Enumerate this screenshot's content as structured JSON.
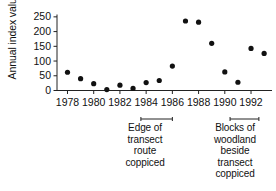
{
  "chart_data": {
    "type": "scatter",
    "title": "",
    "xlabel": "",
    "ylabel": "Annual index value",
    "x": [
      1978,
      1979,
      1980,
      1981,
      1982,
      1983,
      1984,
      1985,
      1986,
      1987,
      1988,
      1989,
      1990,
      1991,
      1992,
      1993
    ],
    "values": [
      62,
      40,
      23,
      3,
      18,
      7,
      27,
      34,
      83,
      236,
      232,
      160,
      63,
      28,
      143,
      126
    ],
    "series": [
      {
        "name": "Annual index value",
        "values": [
          62,
          40,
          23,
          3,
          18,
          7,
          27,
          34,
          83,
          236,
          232,
          160,
          63,
          28,
          143,
          126
        ]
      }
    ],
    "xlim": [
      1977.2,
      1993.6
    ],
    "ylim": [
      0,
      258
    ],
    "xticks": [
      1978,
      1980,
      1982,
      1984,
      1986,
      1988,
      1990,
      1992
    ],
    "xticklabels": [
      "1978",
      "1980",
      "1982",
      "1984",
      "1986",
      "1988",
      "1990",
      "1992"
    ],
    "yticks": [
      0,
      50,
      100,
      150,
      200,
      250
    ],
    "yticklabels": [
      "0",
      "50",
      "100",
      "150",
      "200",
      "250"
    ],
    "grid": false,
    "legend": null,
    "marker": "filled-circle",
    "marker_color": "#111111",
    "annotations": [
      {
        "id": "left",
        "span_start": 1983.6,
        "span_end": 1986.0,
        "lines": [
          "Edge of",
          "transect",
          "route",
          "coppiced"
        ]
      },
      {
        "id": "right",
        "span_start": 1990.4,
        "span_end": 1992.6,
        "lines": [
          "Blocks of",
          "woodland",
          "beside",
          "transect",
          "coppiced"
        ]
      }
    ]
  },
  "axis": {
    "y_label": "Annual index value"
  }
}
